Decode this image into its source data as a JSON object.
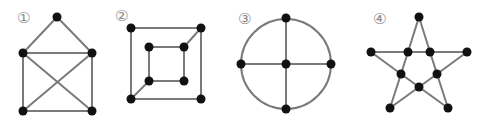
{
  "figures": [
    {
      "id": "figure-1",
      "label": "①",
      "label_pos": [
        17,
        23
      ],
      "nodes": [
        [
          57,
          17
        ],
        [
          23,
          53
        ],
        [
          92,
          53
        ],
        [
          23,
          111
        ],
        [
          92,
          111
        ]
      ],
      "edges": [
        [
          0,
          1
        ],
        [
          0,
          2
        ],
        [
          1,
          2
        ],
        [
          1,
          3
        ],
        [
          2,
          4
        ],
        [
          3,
          4
        ],
        [
          1,
          4
        ],
        [
          2,
          3
        ]
      ],
      "circles": []
    },
    {
      "id": "figure-2",
      "label": "②",
      "label_pos": [
        115,
        21
      ],
      "nodes": [
        [
          131,
          28
        ],
        [
          201,
          28
        ],
        [
          131,
          99
        ],
        [
          201,
          99
        ],
        [
          149,
          47
        ],
        [
          184,
          47
        ],
        [
          149,
          81
        ],
        [
          184,
          81
        ]
      ],
      "edges": [
        [
          0,
          1
        ],
        [
          1,
          3
        ],
        [
          3,
          2
        ],
        [
          2,
          0
        ],
        [
          4,
          5
        ],
        [
          5,
          7
        ],
        [
          7,
          6
        ],
        [
          6,
          4
        ],
        [
          1,
          5
        ],
        [
          2,
          6
        ]
      ],
      "circles": []
    },
    {
      "id": "figure-3",
      "label": "③",
      "label_pos": [
        238,
        24
      ],
      "nodes": [
        [
          286,
          18
        ],
        [
          241,
          64
        ],
        [
          286,
          64
        ],
        [
          331,
          64
        ],
        [
          286,
          109
        ]
      ],
      "edges": [
        [
          0,
          2
        ],
        [
          2,
          4
        ],
        [
          1,
          2
        ],
        [
          2,
          3
        ]
      ],
      "circles": [
        {
          "cx": 286,
          "cy": 64,
          "r": 45
        }
      ]
    },
    {
      "id": "figure-4",
      "label": "④",
      "label_pos": [
        373,
        24
      ],
      "nodes": [
        [
          419,
          17
        ],
        [
          371,
          52
        ],
        [
          408,
          52
        ],
        [
          430,
          52
        ],
        [
          467,
          52
        ],
        [
          401,
          74
        ],
        [
          437,
          74
        ],
        [
          419,
          87
        ],
        [
          390,
          108
        ],
        [
          448,
          108
        ]
      ],
      "edges": [
        [
          0,
          2
        ],
        [
          0,
          3
        ],
        [
          1,
          2
        ],
        [
          2,
          3
        ],
        [
          3,
          4
        ],
        [
          1,
          5
        ],
        [
          4,
          6
        ],
        [
          2,
          5
        ],
        [
          3,
          6
        ],
        [
          5,
          7
        ],
        [
          6,
          7
        ],
        [
          5,
          8
        ],
        [
          6,
          9
        ],
        [
          8,
          7
        ],
        [
          9,
          7
        ]
      ],
      "circles": []
    }
  ]
}
